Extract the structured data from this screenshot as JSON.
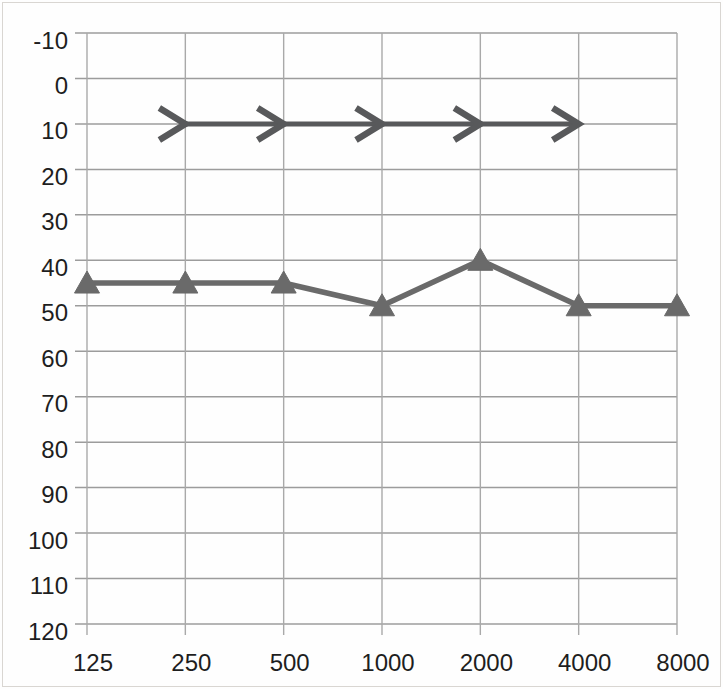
{
  "page": {
    "background_color": "#fefefe",
    "scan_border_color": "#d9d6d2"
  },
  "chart_data": {
    "type": "line",
    "title": "",
    "subtitle": "",
    "xlabel": "",
    "ylabel": "",
    "legend": "none",
    "grid": true,
    "categories": [
      "125",
      "250",
      "500",
      "1000",
      "2000",
      "4000",
      "8000"
    ],
    "y_axis": {
      "min": -10,
      "max": 120,
      "step": 10,
      "inverted": true,
      "tick_labels": [
        "-10",
        "0",
        "10",
        "20",
        "30",
        "40",
        "50",
        "60",
        "70",
        "80",
        "90",
        "100",
        "110",
        "120"
      ]
    },
    "x_axis": {
      "tick_labels": [
        "125",
        "250",
        "500",
        "1000",
        "2000",
        "4000",
        "8000"
      ]
    },
    "colors": {
      "horizontal_grid": "#9c9c9c",
      "vertical_grid": "#a9a9a9",
      "tick_text": "#1e1e1e"
    },
    "series": [
      {
        "name": "bone-conduction-arrows",
        "marker": "right-arrow",
        "color": "#58595b",
        "line_width": 5,
        "points": [
          {
            "x": "250",
            "y": 10
          },
          {
            "x": "500",
            "y": 10
          },
          {
            "x": "1000",
            "y": 10
          },
          {
            "x": "2000",
            "y": 10
          },
          {
            "x": "4000",
            "y": 10
          }
        ]
      },
      {
        "name": "air-conduction-triangles",
        "marker": "filled-triangle",
        "color": "#6a6a6a",
        "line_width": 5.5,
        "points": [
          {
            "x": "125",
            "y": 45
          },
          {
            "x": "250",
            "y": 45
          },
          {
            "x": "500",
            "y": 45
          },
          {
            "x": "1000",
            "y": 50
          },
          {
            "x": "2000",
            "y": 40
          },
          {
            "x": "4000",
            "y": 50
          },
          {
            "x": "8000",
            "y": 50
          }
        ]
      }
    ]
  }
}
